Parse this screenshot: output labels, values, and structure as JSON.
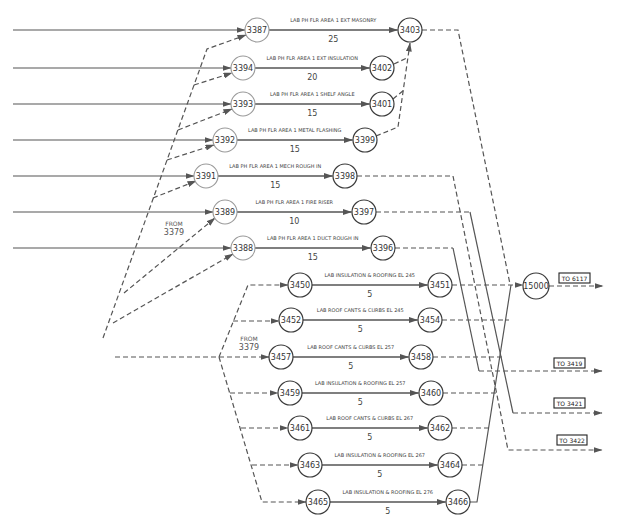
{
  "diagram": {
    "kind": "activity-on-arrow network",
    "node_radius": 12,
    "nodes": [
      {
        "id": "3387",
        "x": 257,
        "y": 30,
        "tone": "light"
      },
      {
        "id": "3403",
        "x": 410,
        "y": 30,
        "tone": "dark"
      },
      {
        "id": "3394",
        "x": 243,
        "y": 68,
        "tone": "light"
      },
      {
        "id": "3402",
        "x": 382,
        "y": 68,
        "tone": "dark"
      },
      {
        "id": "3393",
        "x": 243,
        "y": 104,
        "tone": "light"
      },
      {
        "id": "3401",
        "x": 382,
        "y": 104,
        "tone": "dark"
      },
      {
        "id": "3392",
        "x": 225,
        "y": 140,
        "tone": "light"
      },
      {
        "id": "3399",
        "x": 365,
        "y": 140,
        "tone": "dark"
      },
      {
        "id": "3391",
        "x": 206,
        "y": 176,
        "tone": "light"
      },
      {
        "id": "3398",
        "x": 345,
        "y": 176,
        "tone": "dark"
      },
      {
        "id": "3389",
        "x": 225,
        "y": 212,
        "tone": "light"
      },
      {
        "id": "3397",
        "x": 364,
        "y": 212,
        "tone": "dark"
      },
      {
        "id": "3388",
        "x": 243,
        "y": 248,
        "tone": "light"
      },
      {
        "id": "3396",
        "x": 383,
        "y": 248,
        "tone": "dark"
      },
      {
        "id": "3450",
        "x": 300,
        "y": 285,
        "tone": "dark"
      },
      {
        "id": "3451",
        "x": 440,
        "y": 285,
        "tone": "dark"
      },
      {
        "id": "3452",
        "x": 291,
        "y": 320,
        "tone": "dark"
      },
      {
        "id": "3454",
        "x": 430,
        "y": 320,
        "tone": "dark"
      },
      {
        "id": "3457",
        "x": 281,
        "y": 357,
        "tone": "dark"
      },
      {
        "id": "3458",
        "x": 421,
        "y": 357,
        "tone": "dark"
      },
      {
        "id": "3459",
        "x": 290,
        "y": 393,
        "tone": "dark"
      },
      {
        "id": "3460",
        "x": 431,
        "y": 393,
        "tone": "dark"
      },
      {
        "id": "3461",
        "x": 300,
        "y": 428,
        "tone": "dark"
      },
      {
        "id": "3462",
        "x": 440,
        "y": 428,
        "tone": "dark"
      },
      {
        "id": "3463",
        "x": 310,
        "y": 465,
        "tone": "dark"
      },
      {
        "id": "3464",
        "x": 450,
        "y": 465,
        "tone": "dark"
      },
      {
        "id": "3465",
        "x": 318,
        "y": 502,
        "tone": "dark"
      },
      {
        "id": "3466",
        "x": 458,
        "y": 502,
        "tone": "dark"
      },
      {
        "id": "15000",
        "x": 536,
        "y": 286,
        "tone": "dark",
        "r": 13
      }
    ],
    "activities": [
      {
        "from": "3387",
        "to": "3403",
        "label": "LAB PH FLR AREA 1 EXT MASONRY",
        "duration": "25"
      },
      {
        "from": "3394",
        "to": "3402",
        "label": "LAB PH FLR AREA 1 EXT INSULATION",
        "duration": "20"
      },
      {
        "from": "3393",
        "to": "3401",
        "label": "LAB PH FLR AREA 1 SHELF ANGLE",
        "duration": "15"
      },
      {
        "from": "3392",
        "to": "3399",
        "label": "LAB PH FLR AREA 1 METAL FLASHING",
        "duration": "15"
      },
      {
        "from": "3391",
        "to": "3398",
        "label": "LAB PH FLR AREA 1 MECH ROUGH IN",
        "duration": "15"
      },
      {
        "from": "3389",
        "to": "3397",
        "label": "LAB PH FLR AREA 1 FIRE RISER",
        "duration": "10"
      },
      {
        "from": "3388",
        "to": "3396",
        "label": "LAB PH FLR AREA 1 DUCT ROUGH IN",
        "duration": "15"
      },
      {
        "from": "3450",
        "to": "3451",
        "label": "LAB INSULATION & ROOFING EL 245",
        "duration": "5"
      },
      {
        "from": "3452",
        "to": "3454",
        "label": "LAB ROOF CANTS & CURBS EL 245",
        "duration": "5"
      },
      {
        "from": "3457",
        "to": "3458",
        "label": "LAB ROOF CANTS & CURBS EL 257",
        "duration": "5"
      },
      {
        "from": "3459",
        "to": "3460",
        "label": "LAB INSULATION & ROOFING EL 257",
        "duration": "5"
      },
      {
        "from": "3461",
        "to": "3462",
        "label": "LAB ROOF CANTS & CURBS EL 267",
        "duration": "5"
      },
      {
        "from": "3463",
        "to": "3464",
        "label": "LAB INSULATION & ROOFING EL 267",
        "duration": "5"
      },
      {
        "from": "3465",
        "to": "3466",
        "label": "LAB INSULATION & ROOFING EL 276",
        "duration": "5"
      }
    ],
    "links": [
      {
        "name": "incoming-3387",
        "style": "solid",
        "arrow": true,
        "points": [
          [
            13,
            30
          ],
          [
            245,
            30
          ]
        ]
      },
      {
        "name": "incoming-3394",
        "style": "solid",
        "arrow": true,
        "points": [
          [
            13,
            68
          ],
          [
            231,
            68
          ]
        ]
      },
      {
        "name": "incoming-3393",
        "style": "solid",
        "arrow": true,
        "points": [
          [
            13,
            104
          ],
          [
            231,
            104
          ]
        ]
      },
      {
        "name": "incoming-3392",
        "style": "solid",
        "arrow": true,
        "points": [
          [
            13,
            140
          ],
          [
            213,
            140
          ]
        ]
      },
      {
        "name": "incoming-3391",
        "style": "solid",
        "arrow": true,
        "points": [
          [
            13,
            176
          ],
          [
            194,
            176
          ]
        ]
      },
      {
        "name": "incoming-3389",
        "style": "solid",
        "arrow": true,
        "points": [
          [
            13,
            212
          ],
          [
            213,
            212
          ]
        ]
      },
      {
        "name": "incoming-3388",
        "style": "solid",
        "arrow": true,
        "points": [
          [
            13,
            248
          ],
          [
            231,
            248
          ]
        ]
      },
      {
        "name": "dummy-fan-3387",
        "style": "dashed",
        "arrow": true,
        "points": [
          [
            103,
            338
          ],
          [
            207,
            49
          ],
          [
            246,
            35
          ]
        ]
      },
      {
        "name": "dummy-to-3394",
        "style": "dashed",
        "arrow": true,
        "points": [
          [
            194,
            85
          ],
          [
            232,
            73
          ]
        ]
      },
      {
        "name": "dummy-to-3393",
        "style": "dashed",
        "arrow": true,
        "points": [
          [
            178,
            130
          ],
          [
            232,
            109
          ]
        ]
      },
      {
        "name": "dummy-to-3392",
        "style": "dashed",
        "arrow": true,
        "points": [
          [
            167,
            160
          ],
          [
            214,
            145
          ]
        ]
      },
      {
        "name": "dummy-to-3391",
        "style": "dashed",
        "arrow": true,
        "points": [
          [
            153,
            198
          ],
          [
            196,
            181
          ]
        ]
      },
      {
        "name": "dummy-to-3389",
        "style": "dashed",
        "arrow": true,
        "points": [
          [
            124,
            293
          ],
          [
            215,
            218
          ]
        ]
      },
      {
        "name": "dummy-to-3388",
        "style": "dashed",
        "arrow": true,
        "points": [
          [
            113,
            323
          ],
          [
            233,
            254
          ]
        ]
      },
      {
        "name": "dummy-to-3457",
        "style": "dashed",
        "arrow": true,
        "points": [
          [
            115,
            357
          ],
          [
            269,
            357
          ]
        ]
      },
      {
        "name": "dummy-to-3450",
        "style": "dashed",
        "arrow": true,
        "points": [
          [
            219,
            357
          ],
          [
            248,
            285
          ],
          [
            288,
            285
          ]
        ]
      },
      {
        "name": "dummy-to-3452",
        "style": "dashed",
        "arrow": true,
        "points": [
          [
            233,
            321
          ],
          [
            279,
            321
          ]
        ]
      },
      {
        "name": "dummy-to-3465",
        "style": "dashed",
        "arrow": true,
        "points": [
          [
            219,
            357
          ],
          [
            262,
            502
          ],
          [
            306,
            502
          ]
        ]
      },
      {
        "name": "dummy-to-3459",
        "style": "dashed",
        "arrow": true,
        "points": [
          [
            230,
            393
          ],
          [
            278,
            393
          ]
        ]
      },
      {
        "name": "dummy-to-3461",
        "style": "dashed",
        "arrow": true,
        "points": [
          [
            241,
            428
          ],
          [
            288,
            428
          ]
        ]
      },
      {
        "name": "dummy-to-3463",
        "style": "dashed",
        "arrow": true,
        "points": [
          [
            252,
            465
          ],
          [
            298,
            465
          ]
        ]
      },
      {
        "name": "dummy-3403-out",
        "style": "dashed",
        "arrow": false,
        "points": [
          [
            422,
            30
          ],
          [
            458,
            30
          ],
          [
            510,
            284
          ]
        ]
      },
      {
        "name": "dummy-3399-to-3403",
        "style": "dashed",
        "arrow": true,
        "points": [
          [
            376,
            136
          ],
          [
            398,
            127
          ],
          [
            410,
            43
          ]
        ]
      },
      {
        "name": "dummy-3401-to-3403",
        "style": "dashed",
        "arrow": false,
        "points": [
          [
            393,
            99
          ],
          [
            404,
            90
          ]
        ]
      },
      {
        "name": "dummy-3402-to-3403",
        "style": "dashed",
        "arrow": false,
        "points": [
          [
            394,
            64
          ],
          [
            407,
            58
          ]
        ]
      },
      {
        "name": "dummy-3398-to-3422",
        "style": "dashed",
        "arrow": true,
        "points": [
          [
            357,
            176
          ],
          [
            453,
            176
          ],
          [
            508,
            450
          ],
          [
            602,
            450
          ]
        ]
      },
      {
        "name": "dummy-3397-out",
        "style": "dashed",
        "arrow": false,
        "points": [
          [
            376,
            212
          ],
          [
            470,
            212
          ]
        ]
      },
      {
        "name": "link-3397-down",
        "style": "solid",
        "arrow": false,
        "points": [
          [
            470,
            212
          ],
          [
            513,
            413
          ]
        ]
      },
      {
        "name": "dummy-to-3421",
        "style": "dashed",
        "arrow": true,
        "points": [
          [
            513,
            413
          ],
          [
            602,
            413
          ]
        ]
      },
      {
        "name": "dummy-3396-out",
        "style": "dashed",
        "arrow": false,
        "points": [
          [
            395,
            248
          ],
          [
            453,
            248
          ]
        ]
      },
      {
        "name": "link-3396-down",
        "style": "solid",
        "arrow": false,
        "points": [
          [
            453,
            248
          ],
          [
            479,
            371
          ]
        ]
      },
      {
        "name": "dummy-to-3419",
        "style": "dashed",
        "arrow": true,
        "points": [
          [
            479,
            371
          ],
          [
            602,
            371
          ]
        ]
      },
      {
        "name": "dummy-3451-to-15000",
        "style": "dashed",
        "arrow": true,
        "points": [
          [
            452,
            285
          ],
          [
            523,
            285
          ]
        ]
      },
      {
        "name": "dummy-3454-out",
        "style": "dashed",
        "arrow": false,
        "points": [
          [
            442,
            320
          ],
          [
            509,
            320
          ]
        ]
      },
      {
        "name": "dummy-3458-out",
        "style": "dashed",
        "arrow": false,
        "points": [
          [
            433,
            357
          ],
          [
            503,
            357
          ]
        ]
      },
      {
        "name": "dummy-3460-out",
        "style": "dashed",
        "arrow": false,
        "points": [
          [
            443,
            393
          ],
          [
            496,
            393
          ]
        ]
      },
      {
        "name": "dummy-3462-out",
        "style": "dashed",
        "arrow": false,
        "points": [
          [
            452,
            428
          ],
          [
            489,
            428
          ]
        ]
      },
      {
        "name": "dummy-3464-out",
        "style": "dashed",
        "arrow": false,
        "points": [
          [
            462,
            465
          ],
          [
            483,
            465
          ]
        ]
      },
      {
        "name": "link-3466-collector",
        "style": "solid",
        "arrow": false,
        "points": [
          [
            470,
            502
          ],
          [
            477,
            502
          ],
          [
            511,
            285
          ]
        ]
      },
      {
        "name": "dummy-15000-to-6117",
        "style": "dashed",
        "arrow": true,
        "points": [
          [
            549,
            286
          ],
          [
            603,
            286
          ]
        ]
      }
    ],
    "notes": [
      {
        "lines": [
          "FROM",
          "3379"
        ],
        "x": 174,
        "y": 223
      },
      {
        "lines": [
          "FROM",
          "3379"
        ],
        "x": 249,
        "y": 338
      }
    ],
    "continuations": [
      {
        "label": "TO 6117",
        "x": 559,
        "y": 273,
        "w": 31,
        "h": 10
      },
      {
        "label": "TO 3419",
        "x": 554,
        "y": 358,
        "w": 31,
        "h": 10
      },
      {
        "label": "TO 3421",
        "x": 554,
        "y": 398,
        "w": 31,
        "h": 10
      },
      {
        "label": "TO 3422",
        "x": 557,
        "y": 435,
        "w": 30,
        "h": 10
      }
    ]
  },
  "colors": {
    "line": "#555555",
    "node_start_stroke": "#9a9a9a",
    "node_end_stroke": "#3a3a3a",
    "text": "#444444"
  }
}
